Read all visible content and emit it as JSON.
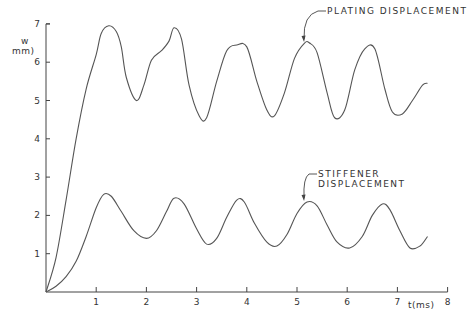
{
  "chart_data": {
    "type": "line",
    "title": "",
    "xlabel": "t(ms)",
    "ylabel": "w\nmm)",
    "ylabel_lines": [
      "w",
      "mm)"
    ],
    "xlim": [
      0,
      8
    ],
    "ylim": [
      0,
      7
    ],
    "grid": false,
    "legend": "none (annotations with arrows)",
    "x_ticks": [
      1,
      2,
      3,
      4,
      5,
      6,
      7,
      8
    ],
    "y_ticks": [
      1,
      2,
      3,
      4,
      5,
      6,
      7
    ],
    "series": [
      {
        "name": "PLATING DISPLACEMENT",
        "x": [
          0,
          0.2,
          0.4,
          0.6,
          0.8,
          1.0,
          1.1,
          1.25,
          1.4,
          1.5,
          1.6,
          1.8,
          1.95,
          2.1,
          2.3,
          2.45,
          2.55,
          2.7,
          2.85,
          3.05,
          3.2,
          3.4,
          3.6,
          3.8,
          4.0,
          4.2,
          4.4,
          4.55,
          4.75,
          4.95,
          5.15,
          5.25,
          5.4,
          5.6,
          5.75,
          5.95,
          6.15,
          6.35,
          6.55,
          6.75,
          6.9,
          7.1,
          7.3,
          7.5,
          7.6
        ],
        "values": [
          0,
          0.9,
          2.4,
          4.0,
          5.3,
          6.2,
          6.75,
          6.95,
          6.8,
          6.4,
          5.6,
          5.0,
          5.4,
          6.05,
          6.3,
          6.55,
          6.9,
          6.6,
          5.4,
          4.6,
          4.55,
          5.5,
          6.3,
          6.45,
          6.4,
          5.5,
          4.75,
          4.6,
          5.2,
          6.1,
          6.5,
          6.5,
          6.25,
          5.2,
          4.55,
          4.75,
          5.8,
          6.35,
          6.35,
          5.3,
          4.7,
          4.65,
          5.0,
          5.4,
          5.45
        ]
      },
      {
        "name": "STIFFENER DISPLACEMENT",
        "x": [
          0,
          0.2,
          0.4,
          0.6,
          0.8,
          1.0,
          1.15,
          1.3,
          1.5,
          1.75,
          2.0,
          2.2,
          2.4,
          2.55,
          2.75,
          3.0,
          3.2,
          3.4,
          3.6,
          3.8,
          3.95,
          4.15,
          4.4,
          4.6,
          4.8,
          5.0,
          5.2,
          5.4,
          5.6,
          5.8,
          6.05,
          6.3,
          6.5,
          6.7,
          6.85,
          7.05,
          7.25,
          7.45,
          7.6
        ],
        "values": [
          0,
          0.15,
          0.4,
          0.8,
          1.45,
          2.2,
          2.55,
          2.5,
          2.1,
          1.6,
          1.4,
          1.6,
          2.1,
          2.45,
          2.3,
          1.65,
          1.25,
          1.4,
          1.95,
          2.4,
          2.35,
          1.8,
          1.3,
          1.2,
          1.5,
          2.05,
          2.35,
          2.25,
          1.75,
          1.3,
          1.15,
          1.45,
          2.0,
          2.3,
          2.15,
          1.6,
          1.15,
          1.2,
          1.45
        ]
      }
    ],
    "annotations": [
      {
        "text": "PLATING DISPLACEMENT",
        "points_to": {
          "x": 5.2,
          "y": 6.5
        }
      },
      {
        "text": "STIFFENER DISPLACEMENT",
        "points_to": {
          "x": 5.2,
          "y": 2.35
        }
      }
    ]
  },
  "labels": {
    "x_axis": "t(ms)",
    "y_axis_top": "w",
    "y_axis_bottom": "mm)",
    "plating": "PLATING  DISPLACEMENT",
    "stiffener": "STIFFENER  DISPLACEMENT"
  },
  "style": {
    "line_color": "#555555",
    "axis_color": "#444444",
    "text_color": "#333333"
  }
}
